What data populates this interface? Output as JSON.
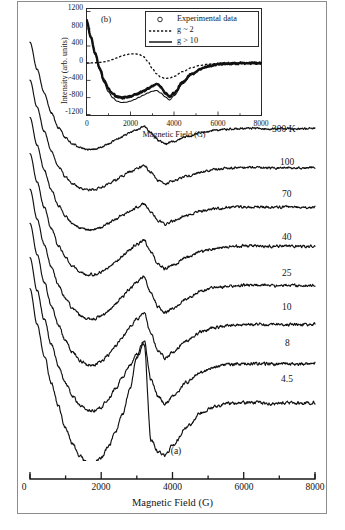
{
  "figure": {
    "panel_a_tag": "(a)",
    "panel_b_tag": "(b)"
  },
  "main_axis": {
    "xlabel": "Magnetic Field (G)",
    "xticks": [
      "0",
      "2000",
      "4000",
      "6000",
      "8000"
    ],
    "xlim": [
      0,
      8000
    ]
  },
  "inset_axis": {
    "xlabel": "Magnetic Field (G)",
    "ylabel": "Intensity (arb. units)",
    "xticks": [
      "0",
      "2000",
      "4000",
      "6000",
      "8000"
    ],
    "yticks": [
      "1200",
      "800",
      "400",
      "0",
      "-400",
      "-800",
      "-1200"
    ],
    "xlim": [
      0,
      8000
    ],
    "ylim": [
      -1200,
      1200
    ]
  },
  "legend": {
    "items": [
      {
        "label": "Experimental data",
        "marker": "circle"
      },
      {
        "label": "g ~ 2",
        "marker": "dashed-line"
      },
      {
        "label": "g > 10",
        "marker": "solid-line"
      }
    ]
  },
  "traces": {
    "labels": [
      "300 K",
      "100",
      "70",
      "40",
      "25",
      "10",
      "8",
      "4.5"
    ]
  },
  "chart_data": {
    "type": "line",
    "title": "",
    "xlabel": "Magnetic Field (G)",
    "ylabel": "",
    "xlim": [
      0,
      8000
    ],
    "grid": false,
    "legend_position": "right-stacked-labels",
    "x": [
      0,
      200,
      400,
      600,
      800,
      1000,
      1200,
      1400,
      1600,
      1800,
      2000,
      2200,
      2400,
      2600,
      2800,
      3000,
      3200,
      3400,
      3600,
      3800,
      4000,
      4400,
      4800,
      5200,
      5600,
      6000,
      6400,
      6800,
      7200,
      7600,
      8000
    ],
    "series": [
      {
        "name": "300 K",
        "values": [
          140,
          96,
          58,
          26,
          2,
          -14,
          -24,
          -30,
          -33,
          -32,
          -29,
          -24,
          -18,
          -12,
          -6,
          -1,
          4,
          -6,
          -18,
          -24,
          -20,
          -12,
          -6,
          -2,
          0,
          1,
          1,
          0,
          1,
          0,
          1
        ]
      },
      {
        "name": "100",
        "values": [
          142,
          98,
          59,
          27,
          3,
          -14,
          -25,
          -32,
          -35,
          -34,
          -31,
          -25,
          -19,
          -12,
          -6,
          -1,
          5,
          -7,
          -20,
          -26,
          -21,
          -13,
          -6,
          -2,
          0,
          1,
          1,
          0,
          1,
          0,
          1
        ]
      },
      {
        "name": "70",
        "values": [
          145,
          100,
          60,
          28,
          3,
          -15,
          -26,
          -33,
          -36,
          -35,
          -32,
          -26,
          -19,
          -12,
          -6,
          0,
          6,
          -8,
          -21,
          -27,
          -22,
          -13,
          -6,
          -2,
          0,
          1,
          1,
          0,
          1,
          0,
          1
        ]
      },
      {
        "name": "40",
        "values": [
          150,
          104,
          63,
          29,
          2,
          -18,
          -31,
          -40,
          -45,
          -45,
          -41,
          -34,
          -25,
          -15,
          -5,
          4,
          10,
          -10,
          -28,
          -36,
          -30,
          -17,
          -8,
          -3,
          0,
          1,
          1,
          0,
          1,
          0,
          1
        ]
      },
      {
        "name": "25",
        "values": [
          156,
          108,
          66,
          30,
          1,
          -21,
          -36,
          -47,
          -53,
          -53,
          -49,
          -40,
          -29,
          -17,
          -5,
          6,
          14,
          -12,
          -34,
          -44,
          -36,
          -21,
          -9,
          -3,
          0,
          1,
          1,
          0,
          1,
          0,
          1
        ]
      },
      {
        "name": "10",
        "values": [
          164,
          114,
          69,
          31,
          -1,
          -26,
          -44,
          -57,
          -64,
          -64,
          -59,
          -48,
          -34,
          -19,
          -4,
          10,
          20,
          -15,
          -42,
          -54,
          -44,
          -25,
          -11,
          -4,
          0,
          1,
          1,
          0,
          1,
          0,
          1
        ]
      },
      {
        "name": "8",
        "values": [
          172,
          119,
          72,
          32,
          -3,
          -31,
          -52,
          -67,
          -75,
          -75,
          -69,
          -56,
          -39,
          -21,
          -2,
          16,
          38,
          -26,
          -52,
          -64,
          -52,
          -29,
          -13,
          -4,
          0,
          1,
          1,
          0,
          1,
          0,
          1
        ]
      },
      {
        "name": "4.5",
        "values": [
          185,
          128,
          77,
          33,
          -6,
          -40,
          -66,
          -85,
          -96,
          -96,
          -88,
          -70,
          -46,
          -18,
          22,
          74,
          96,
          -60,
          -78,
          -84,
          -68,
          -38,
          -16,
          -5,
          0,
          1,
          1,
          0,
          1,
          0,
          1
        ]
      }
    ],
    "inset": {
      "type": "line",
      "xlabel": "Magnetic Field (G)",
      "ylabel": "Intensity (arb. units)",
      "xlim": [
        0,
        8000
      ],
      "ylim": [
        -1200,
        1200
      ],
      "x": [
        0,
        200,
        400,
        600,
        800,
        1000,
        1200,
        1400,
        1600,
        1800,
        2000,
        2200,
        2400,
        2600,
        2800,
        3000,
        3200,
        3400,
        3600,
        3800,
        4000,
        4400,
        4800,
        5200,
        5600,
        6000,
        6400,
        6800,
        7200,
        7600,
        8000
      ],
      "series": [
        {
          "name": "Experimental data",
          "values": [
            1000,
            600,
            220,
            -120,
            -400,
            -600,
            -720,
            -790,
            -810,
            -800,
            -775,
            -740,
            -700,
            -650,
            -600,
            -540,
            -470,
            -560,
            -700,
            -790,
            -700,
            -450,
            -260,
            -140,
            -70,
            -30,
            -12,
            -6,
            -2,
            0,
            0
          ]
        },
        {
          "name": "g ~ 2",
          "values": [
            0,
            2,
            6,
            14,
            28,
            50,
            82,
            120,
            160,
            192,
            210,
            216,
            200,
            150,
            40,
            -120,
            -250,
            -330,
            -360,
            -350,
            -310,
            -200,
            -110,
            -55,
            -25,
            -10,
            -4,
            -2,
            0,
            0,
            0
          ]
        },
        {
          "name": "g > 10",
          "values": [
            1000,
            590,
            200,
            -150,
            -450,
            -670,
            -810,
            -890,
            -920,
            -915,
            -890,
            -850,
            -800,
            -750,
            -700,
            -660,
            -640,
            -700,
            -790,
            -860,
            -760,
            -480,
            -270,
            -145,
            -72,
            -32,
            -13,
            -6,
            -2,
            0,
            0
          ]
        }
      ]
    }
  }
}
